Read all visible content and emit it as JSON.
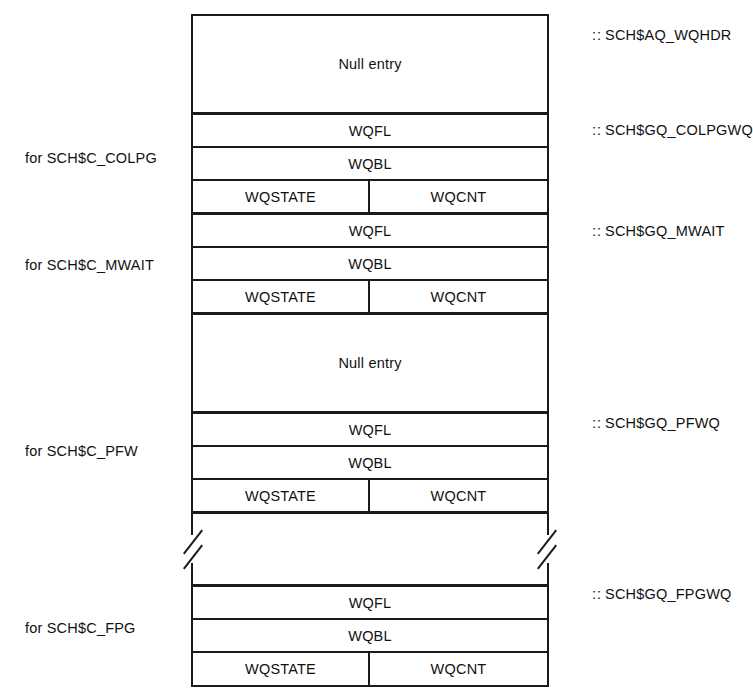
{
  "diagram": {
    "field_labels": {
      "null_entry": "Null entry",
      "wqfl": "WQFL",
      "wqbl": "WQBL",
      "wqstate": "WQSTATE",
      "wqcnt": "WQCNT"
    },
    "colors": {
      "line": "#1a1a1a",
      "background": "#ffffff",
      "text": "#111111"
    },
    "rows": [
      {
        "kind": "null-entry",
        "cells": [
          "Null entry"
        ]
      },
      {
        "kind": "field",
        "cells": [
          "WQFL"
        ]
      },
      {
        "kind": "field",
        "cells": [
          "WQBL"
        ]
      },
      {
        "kind": "fields",
        "cells": [
          "WQSTATE",
          "WQCNT"
        ]
      },
      {
        "kind": "field",
        "cells": [
          "WQFL"
        ]
      },
      {
        "kind": "field",
        "cells": [
          "WQBL"
        ]
      },
      {
        "kind": "fields",
        "cells": [
          "WQSTATE",
          "WQCNT"
        ]
      },
      {
        "kind": "null-entry",
        "cells": [
          "Null entry"
        ]
      },
      {
        "kind": "field",
        "cells": [
          "WQFL"
        ]
      },
      {
        "kind": "field",
        "cells": [
          "WQBL"
        ]
      },
      {
        "kind": "fields",
        "cells": [
          "WQSTATE",
          "WQCNT"
        ]
      },
      {
        "kind": "break",
        "cells": []
      },
      {
        "kind": "field",
        "cells": [
          "WQFL"
        ]
      },
      {
        "kind": "field",
        "cells": [
          "WQBL"
        ]
      },
      {
        "kind": "fields",
        "cells": [
          "WQSTATE",
          "WQCNT"
        ]
      }
    ],
    "left_labels": [
      {
        "text": "for SCH$C_COLPG",
        "top": 150
      },
      {
        "text": "for SCH$C_MWAIT",
        "top": 257
      },
      {
        "text": "for SCH$C_PFW",
        "top": 443
      },
      {
        "text": "for SCH$C_FPG",
        "top": 620
      }
    ],
    "right_labels": [
      {
        "colons": "::",
        "text": "SCH$AQ_WQHDR",
        "top": 27
      },
      {
        "colons": "::",
        "text": "SCH$GQ_COLPGWQ",
        "top": 122
      },
      {
        "colons": "::",
        "text": "SCH$GQ_MWAIT",
        "top": 223
      },
      {
        "colons": "::",
        "text": "SCH$GQ_PFWQ",
        "top": 415
      },
      {
        "colons": "::",
        "text": "SCH$GQ_FPGWQ",
        "top": 586
      }
    ]
  }
}
